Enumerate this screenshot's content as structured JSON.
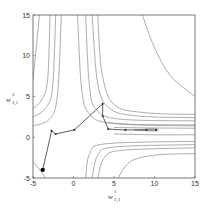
{
  "chart_data": {
    "type": "line",
    "subtype": "contour-with-trajectory",
    "title": "",
    "xlabel": "w^1_{1,1}",
    "ylabel": "w^2_{1,1}",
    "xlim": [
      -5,
      15
    ],
    "ylim": [
      -5,
      15
    ],
    "xticks": [
      -5,
      0,
      5,
      10,
      15
    ],
    "yticks": [
      -5,
      0,
      5,
      10,
      15
    ],
    "grid": false,
    "legend": null,
    "colors": {
      "contour": "#8a8a8a",
      "trajectory": "#333333",
      "axis": "#555555",
      "start_marker": "#000000"
    },
    "trajectory": {
      "name": "optimization path",
      "points": [
        {
          "x": -3.8,
          "y": -4.0
        },
        {
          "x": -2.7,
          "y": 0.8
        },
        {
          "x": -2.2,
          "y": 0.4
        },
        {
          "x": 0.1,
          "y": 0.9
        },
        {
          "x": 3.6,
          "y": 4.1
        },
        {
          "x": 3.6,
          "y": 2.6
        },
        {
          "x": 4.3,
          "y": 1.0
        },
        {
          "x": 6.4,
          "y": 0.9
        },
        {
          "x": 9.0,
          "y": 0.9
        },
        {
          "x": 10.2,
          "y": 0.9
        }
      ]
    },
    "contours": [
      {
        "side": "upper-left",
        "points": [
          [
            -5,
            7
          ],
          [
            -4.6,
            11
          ],
          [
            -4.2,
            15
          ]
        ]
      },
      {
        "side": "upper-left",
        "points": [
          [
            -5,
            3.5
          ],
          [
            -4,
            4.5
          ],
          [
            -3.2,
            7
          ],
          [
            -2.9,
            15
          ]
        ]
      },
      {
        "side": "upper-left",
        "points": [
          [
            -5,
            2.5
          ],
          [
            -3.5,
            3.5
          ],
          [
            -2.6,
            6
          ],
          [
            -2.2,
            15
          ]
        ]
      },
      {
        "side": "upper-left",
        "points": [
          [
            -5,
            1.4
          ],
          [
            -3,
            2.2
          ],
          [
            -2,
            5
          ],
          [
            -1.5,
            15
          ]
        ]
      },
      {
        "side": "upper-right",
        "points": [
          [
            0.5,
            15
          ],
          [
            1,
            6
          ],
          [
            2,
            2.8
          ],
          [
            5,
            1.7
          ],
          [
            15,
            1.5
          ]
        ]
      },
      {
        "side": "upper-right",
        "points": [
          [
            1.5,
            15
          ],
          [
            2,
            6
          ],
          [
            3,
            3.2
          ],
          [
            6,
            2.2
          ],
          [
            15,
            2.0
          ]
        ]
      },
      {
        "side": "upper-right",
        "points": [
          [
            2.3,
            15
          ],
          [
            3,
            6.5
          ],
          [
            4.5,
            3.5
          ],
          [
            8,
            2.6
          ],
          [
            15,
            2.4
          ]
        ]
      },
      {
        "side": "upper-right",
        "points": [
          [
            3,
            15
          ],
          [
            3.5,
            8
          ],
          [
            5,
            4
          ],
          [
            9,
            3
          ],
          [
            15,
            2.8
          ]
        ]
      },
      {
        "side": "upper-right",
        "points": [
          [
            8.5,
            15
          ],
          [
            10,
            11
          ],
          [
            12,
            7.5
          ],
          [
            15,
            5
          ]
        ]
      },
      {
        "side": "lower-right",
        "points": [
          [
            1.5,
            -5
          ],
          [
            2,
            -2
          ],
          [
            4,
            -0.8
          ],
          [
            15,
            -0.5
          ]
        ]
      },
      {
        "side": "lower-right",
        "points": [
          [
            2.3,
            -5
          ],
          [
            3,
            -2.2
          ],
          [
            5,
            -1.2
          ],
          [
            15,
            -0.9
          ]
        ]
      },
      {
        "side": "lower-right",
        "points": [
          [
            3,
            -5
          ],
          [
            3.8,
            -2.5
          ],
          [
            6,
            -1.6
          ],
          [
            15,
            -1.3
          ]
        ]
      },
      {
        "side": "lower-right",
        "points": [
          [
            5.5,
            -5
          ],
          [
            7,
            -3
          ],
          [
            10,
            -2.2
          ],
          [
            15,
            -2.0
          ]
        ]
      },
      {
        "side": "valley",
        "points": [
          [
            4,
            1.8
          ],
          [
            8,
            1.5
          ],
          [
            15,
            1.4
          ]
        ]
      },
      {
        "side": "valley",
        "points": [
          [
            5,
            1.2
          ],
          [
            9,
            1.15
          ],
          [
            15,
            1.1
          ]
        ]
      },
      {
        "side": "valley",
        "points": [
          [
            5,
            0.4
          ],
          [
            10,
            0.3
          ],
          [
            15,
            0.3
          ]
        ]
      },
      {
        "side": "valley",
        "points": [
          [
            7.5,
            0.9
          ],
          [
            10,
            1.05
          ],
          [
            10.5,
            0.9
          ],
          [
            10,
            0.75
          ],
          [
            7.5,
            0.9
          ]
        ]
      },
      {
        "side": "lower-left",
        "points": [
          [
            -5,
            -3
          ],
          [
            -4,
            -4.2
          ],
          [
            -3.5,
            -5
          ]
        ]
      }
    ]
  },
  "labels": {
    "xlabel_main": "w",
    "xlabel_sup": "1",
    "xlabel_sub": "1,1",
    "ylabel_main": "w",
    "ylabel_sup": "2",
    "ylabel_sub": "1,1"
  }
}
